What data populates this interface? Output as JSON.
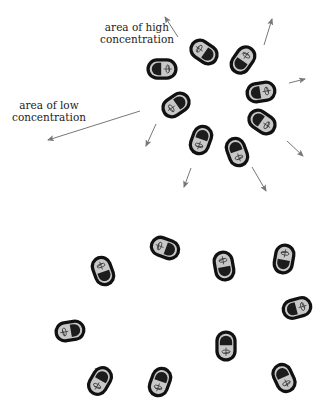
{
  "labels": {
    "high": {
      "line1": "area of high",
      "line2": "concentration"
    },
    "low": {
      "line1": "area of low",
      "line2": "concentration"
    }
  },
  "colors": {
    "cell_wall": "#111111",
    "cytoplasm": "#c8c8c8",
    "nucleoid": "#1c1c1c",
    "flagellum": "#333333",
    "arrow": "#777777",
    "text": "#222222"
  },
  "upper_cluster": {
    "name": "area of high concentration",
    "cells": [
      {
        "x": 162,
        "y": 69,
        "angle": 0
      },
      {
        "x": 204,
        "y": 52,
        "angle": 215
      },
      {
        "x": 243,
        "y": 60,
        "angle": -55
      },
      {
        "x": 261,
        "y": 92,
        "angle": -10
      },
      {
        "x": 262,
        "y": 122,
        "angle": 35
      },
      {
        "x": 176,
        "y": 105,
        "angle": 145
      },
      {
        "x": 201,
        "y": 140,
        "angle": 110
      },
      {
        "x": 237,
        "y": 152,
        "angle": 70
      }
    ],
    "arrows": [
      {
        "x1": 178,
        "y1": 37,
        "x2": 165,
        "y2": 17
      },
      {
        "x1": 264,
        "y1": 45,
        "x2": 272,
        "y2": 19
      },
      {
        "x1": 289,
        "y1": 83,
        "x2": 305,
        "y2": 79
      },
      {
        "x1": 287,
        "y1": 141,
        "x2": 303,
        "y2": 156
      },
      {
        "x1": 252,
        "y1": 167,
        "x2": 266,
        "y2": 191
      },
      {
        "x1": 191,
        "y1": 168,
        "x2": 184,
        "y2": 187
      },
      {
        "x1": 156,
        "y1": 124,
        "x2": 146,
        "y2": 146
      },
      {
        "x1": 140,
        "y1": 111,
        "x2": 48,
        "y2": 140
      }
    ]
  },
  "lower_cluster": {
    "name": "dispersed cells",
    "cells": [
      {
        "x": 103,
        "y": 271,
        "angle": -110
      },
      {
        "x": 165,
        "y": 248,
        "angle": 200
      },
      {
        "x": 224,
        "y": 266,
        "angle": -100
      },
      {
        "x": 284,
        "y": 259,
        "angle": -80
      },
      {
        "x": 297,
        "y": 308,
        "angle": -15
      },
      {
        "x": 70,
        "y": 331,
        "angle": 170
      },
      {
        "x": 226,
        "y": 346,
        "angle": 90
      },
      {
        "x": 100,
        "y": 381,
        "angle": 120
      },
      {
        "x": 160,
        "y": 382,
        "angle": 110
      },
      {
        "x": 284,
        "y": 378,
        "angle": 65
      }
    ]
  }
}
